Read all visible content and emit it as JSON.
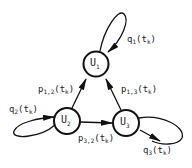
{
  "diagram": {
    "type": "markov-chain",
    "nodes": [
      {
        "id": "U1",
        "label": "U",
        "sub": "1"
      },
      {
        "id": "U2",
        "label": "U",
        "sub": "2"
      },
      {
        "id": "U3",
        "label": "U",
        "sub": "3"
      }
    ],
    "edges": [
      {
        "from": "U1",
        "to": "U1",
        "label": "q",
        "sub": "1",
        "arg": "(t",
        "argsub": "k",
        "close": ")"
      },
      {
        "from": "U2",
        "to": "U2",
        "label": "q",
        "sub": "2",
        "arg": "(t",
        "argsub": "k",
        "close": ")"
      },
      {
        "from": "U3",
        "to": "U3",
        "label": "q",
        "sub": "3",
        "arg": "(t",
        "argsub": "k",
        "close": ")"
      },
      {
        "from": "U2",
        "to": "U1",
        "label": "p",
        "sub": "1,2",
        "arg": "(t",
        "argsub": "k",
        "close": ")"
      },
      {
        "from": "U3",
        "to": "U1",
        "label": "p",
        "sub": "1,3",
        "arg": "(t",
        "argsub": "k",
        "close": ")"
      },
      {
        "from": "U2",
        "to": "U3",
        "label": "p",
        "sub": "3,2",
        "arg": "(t",
        "argsub": "k",
        "close": ")"
      }
    ]
  }
}
